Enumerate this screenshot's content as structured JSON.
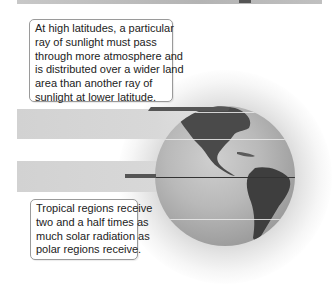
{
  "header": {
    "title_fragment": "gy"
  },
  "diagram": {
    "callouts": {
      "high_latitude": {
        "lines": [
          "At high latitudes, a particular",
          "ray of sunlight must pass",
          "through more atmosphere and",
          "is distributed over a wider land",
          "area than another ray of",
          "sunlight at lower latitude."
        ]
      },
      "tropical": {
        "lines": [
          "Tropical regions receive",
          "two and a half times as",
          "much solar radiation as",
          "polar regions receive."
        ]
      }
    },
    "elements": {
      "globe": "Earth globe showing the Americas",
      "upper_band": "sunlight band at high latitude",
      "lower_band": "sunlight band at low (tropical) latitude"
    },
    "colors": {
      "band": "#d4d4d4",
      "ray": "#555555",
      "globe_ocean": "#b0b0b0",
      "globe_land": "#4a4a4a",
      "callout_border": "#9a9a9a"
    }
  }
}
